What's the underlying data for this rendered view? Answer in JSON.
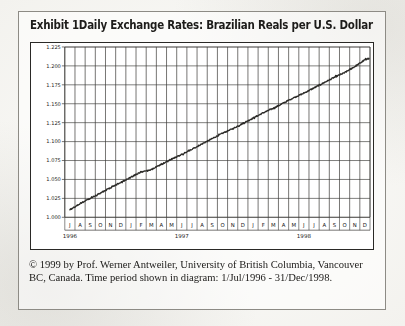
{
  "figure": {
    "exhibit_label": "Exhibit 1",
    "title": "Exhibit 1Daily Exchange Rates: Brazilian Reals per U.S. Dollar",
    "caption": "© 1999 by Prof. Werner Antweiler, University of British Columbia, Vancouver BC, Canada. Time period shown in diagram: 1/Jul/1996 - 31/Dec/1998."
  },
  "chart_data": {
    "type": "line",
    "title": "Daily Exchange Rates: Brazilian Reals per U.S. Dollar",
    "xlabel": "",
    "ylabel": "",
    "grid": true,
    "legend": "none",
    "ylim": [
      1.0,
      1.225
    ],
    "yticks": [
      1.225,
      1.2,
      1.175,
      1.15,
      1.125,
      1.1,
      1.075,
      1.05,
      1.025,
      1.0
    ],
    "ytick_labels": [
      "1.225",
      "1.200",
      "1.175",
      "1.150",
      "1.125",
      "1.100",
      "1.075",
      "1.050",
      "1.025",
      "1.000"
    ],
    "xtick_labels": [
      "J",
      "A",
      "S",
      "O",
      "N",
      "D",
      "J",
      "F",
      "M",
      "A",
      "M",
      "J",
      "J",
      "A",
      "S",
      "O",
      "N",
      "D",
      "J",
      "F",
      "M",
      "A",
      "M",
      "J",
      "J",
      "A",
      "S",
      "O",
      "N",
      "D"
    ],
    "year_labels": [
      {
        "text": "1996",
        "month_index": 0
      },
      {
        "text": "1997",
        "month_index": 11
      },
      {
        "text": "1998",
        "month_index": 23
      }
    ],
    "x": [
      "1996-07",
      "1996-08",
      "1996-09",
      "1996-10",
      "1996-11",
      "1996-12",
      "1997-01",
      "1997-02",
      "1997-03",
      "1997-04",
      "1997-05",
      "1997-06",
      "1997-07",
      "1997-08",
      "1997-09",
      "1997-10",
      "1997-11",
      "1997-12",
      "1998-01",
      "1998-02",
      "1998-03",
      "1998-04",
      "1998-05",
      "1998-06",
      "1998-07",
      "1998-08",
      "1998-09",
      "1998-10",
      "1998-11",
      "1998-12"
    ],
    "series": [
      {
        "name": "BRL per USD",
        "values": [
          1.01,
          1.018,
          1.025,
          1.032,
          1.039,
          1.046,
          1.053,
          1.06,
          1.063,
          1.07,
          1.077,
          1.083,
          1.09,
          1.097,
          1.104,
          1.111,
          1.117,
          1.124,
          1.131,
          1.138,
          1.144,
          1.151,
          1.158,
          1.164,
          1.171,
          1.178,
          1.185,
          1.191,
          1.199,
          1.208
        ],
        "start_value": 1.01,
        "end_value": 1.21,
        "color": "#2b2a27"
      }
    ],
    "period_start": "1/Jul/1996",
    "period_end": "31/Dec/1998"
  }
}
